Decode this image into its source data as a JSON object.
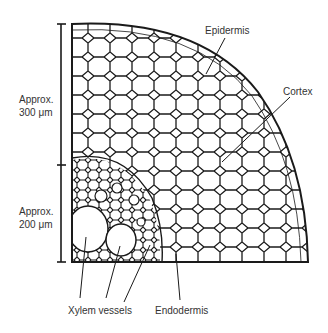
{
  "diagram": {
    "labels": {
      "epidermis": "Epidermis",
      "cortex": "Cortex",
      "xylem": "Xylem vessels",
      "endodermis": "Endodermis",
      "scale_top_line1": "Approx.",
      "scale_top_line2": "300 μm",
      "scale_bottom_line1": "Approx.",
      "scale_bottom_line2": "200 μm"
    },
    "colors": {
      "line": "#1a1a1a",
      "background": "#ffffff"
    }
  }
}
